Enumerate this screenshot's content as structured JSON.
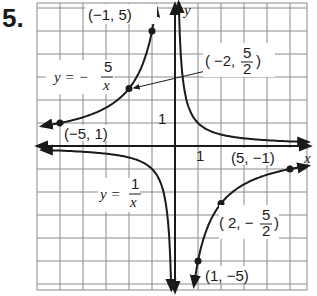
{
  "problem_number": "5.",
  "chart_data": {
    "type": "line",
    "title": "",
    "xlabel": "x",
    "ylabel": "y",
    "xlim": [
      -6,
      5.8
    ],
    "ylim": [
      -6,
      6.2
    ],
    "grid": true,
    "tick_labels": {
      "x": [
        "1"
      ],
      "y": [
        "1"
      ]
    },
    "series": [
      {
        "name": "y = 1/x",
        "equation": "y = 1/x",
        "style": "curve with arrows, reference graph"
      },
      {
        "name": "y = -5/x",
        "equation": "y = -5/x",
        "style": "curve with arrows and labeled points",
        "points": [
          {
            "x": -5,
            "y": 1,
            "label": "(-5, 1)"
          },
          {
            "x": -2,
            "y": 2.5,
            "label": "(-2, 5/2)"
          },
          {
            "x": -1,
            "y": 5,
            "label": "(-1, 5)"
          },
          {
            "x": 1,
            "y": -5,
            "label": "(1, -5)"
          },
          {
            "x": 2,
            "y": -2.5,
            "label": "(2, -5/2)"
          },
          {
            "x": 5,
            "y": -1,
            "label": "(5, -1)"
          }
        ]
      }
    ],
    "annotations": [
      {
        "text": "y = -5/x",
        "position": "left upper"
      },
      {
        "text": "y = 1/x",
        "position": "left lower"
      }
    ]
  },
  "labels": {
    "eq1_lhs": "y = −",
    "eq1_num": "5",
    "eq1_den": "x",
    "eq2_lhs": "y =",
    "eq2_num": "1",
    "eq2_den": "x",
    "p1": "(−1, 5)",
    "p2a": "−2,",
    "p2num": "5",
    "p2den": "2",
    "p3": "(−5, 1)",
    "p4": "(5, −1)",
    "p5a": "2, −",
    "p5num": "5",
    "p5den": "2",
    "p6": "(1, −5)",
    "xaxis": "x",
    "yaxis": "y",
    "xtick": "1",
    "ytick": "1"
  }
}
